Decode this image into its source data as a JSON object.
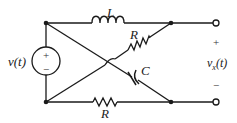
{
  "circuit": {
    "source_label": "v(t)",
    "source_plus": "+",
    "source_minus": "−",
    "inductor_label": "L",
    "resistor_top_label": "R",
    "capacitor_label": "C",
    "resistor_bottom_label": "R",
    "output_label": "v",
    "output_subscript": "x",
    "output_suffix": "(t)",
    "output_plus": "+",
    "output_minus": "−",
    "line_color": "#1a1a1a"
  }
}
